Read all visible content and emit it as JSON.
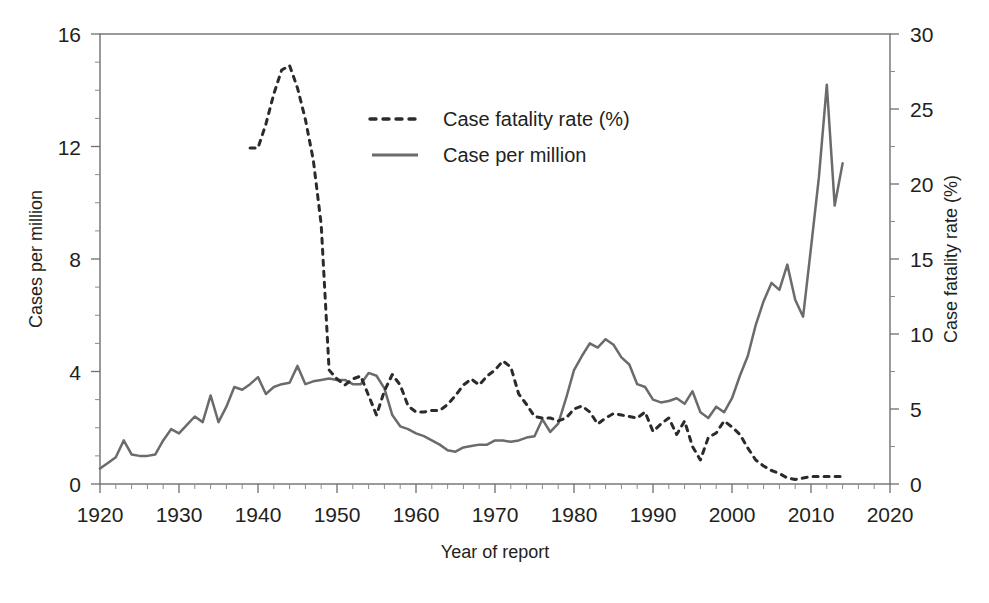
{
  "chart_data": {
    "type": "line",
    "title": "",
    "xlabel": "Year of report",
    "ylabel": "Cases per million",
    "y2label": "Case fatality rate (%)",
    "xlim": [
      1920,
      2020
    ],
    "ylim": [
      0,
      16
    ],
    "y2lim": [
      0,
      30
    ],
    "xticks": [
      1920,
      1930,
      1940,
      1950,
      1960,
      1970,
      1980,
      1990,
      2000,
      2010,
      2020
    ],
    "yticks": [
      0,
      4,
      8,
      12,
      16
    ],
    "y2ticks": [
      0,
      5,
      10,
      15,
      20,
      25,
      30
    ],
    "xtick_labels": [
      "1920",
      "1930",
      "1940",
      "1950",
      "1960",
      "1970",
      "1980",
      "1990",
      "2000",
      "2010",
      "2020"
    ],
    "ytick_labels": [
      "0",
      "4",
      "8",
      "12",
      "16"
    ],
    "y2tick_labels": [
      "0",
      "5",
      "10",
      "15",
      "20",
      "25",
      "30"
    ],
    "minor_tick_interval": 2,
    "grid": false,
    "legend_position": "upper-center",
    "series": [
      {
        "name": "Case fatality rate (%)",
        "axis": "right",
        "style": "dashed",
        "color": "#2b2b2b",
        "x": [
          1939,
          1940,
          1941,
          1942,
          1943,
          1944,
          1945,
          1946,
          1947,
          1948,
          1949,
          1950,
          1951,
          1952,
          1953,
          1954,
          1955,
          1956,
          1957,
          1958,
          1959,
          1960,
          1961,
          1962,
          1963,
          1964,
          1965,
          1966,
          1967,
          1968,
          1969,
          1970,
          1971,
          1972,
          1973,
          1974,
          1975,
          1976,
          1977,
          1978,
          1979,
          1980,
          1981,
          1982,
          1983,
          1984,
          1985,
          1986,
          1987,
          1988,
          1989,
          1990,
          1991,
          1992,
          1993,
          1994,
          1995,
          1996,
          1997,
          1998,
          1999,
          2000,
          2001,
          2002,
          2003,
          2004,
          2005,
          2006,
          2007,
          2008,
          2009,
          2010,
          2011,
          2012,
          2013,
          2014
        ],
        "values": [
          22.4,
          22.4,
          24.0,
          26.0,
          27.6,
          27.9,
          26.4,
          24.3,
          21.6,
          17.3,
          7.6,
          7.0,
          6.6,
          7.0,
          7.2,
          5.9,
          4.6,
          6.2,
          7.3,
          6.6,
          5.2,
          4.8,
          4.8,
          4.9,
          4.9,
          5.3,
          5.9,
          6.6,
          7.0,
          6.6,
          7.2,
          7.6,
          8.2,
          7.8,
          6.0,
          5.3,
          4.5,
          4.4,
          4.4,
          4.2,
          4.4,
          5.0,
          5.2,
          4.8,
          4.0,
          4.4,
          4.7,
          4.6,
          4.5,
          4.4,
          4.8,
          3.5,
          4.0,
          4.4,
          3.3,
          4.2,
          2.5,
          1.6,
          3.1,
          3.4,
          4.2,
          3.8,
          3.3,
          2.4,
          1.6,
          1.2,
          0.9,
          0.7,
          0.4,
          0.3,
          0.4,
          0.5,
          0.5,
          0.5,
          0.5,
          0.5
        ]
      },
      {
        "name": "Case per million",
        "axis": "left",
        "style": "solid",
        "color": "#6b6b6b",
        "x": [
          1920,
          1921,
          1922,
          1923,
          1924,
          1925,
          1926,
          1927,
          1928,
          1929,
          1930,
          1931,
          1932,
          1933,
          1934,
          1935,
          1936,
          1937,
          1938,
          1939,
          1940,
          1941,
          1942,
          1943,
          1944,
          1945,
          1946,
          1947,
          1948,
          1949,
          1950,
          1951,
          1952,
          1953,
          1954,
          1955,
          1956,
          1957,
          1958,
          1959,
          1960,
          1961,
          1962,
          1963,
          1964,
          1965,
          1966,
          1967,
          1968,
          1969,
          1970,
          1971,
          1972,
          1973,
          1974,
          1975,
          1976,
          1977,
          1978,
          1979,
          1980,
          1981,
          1982,
          1983,
          1984,
          1985,
          1986,
          1987,
          1988,
          1989,
          1990,
          1991,
          1992,
          1993,
          1994,
          1995,
          1996,
          1997,
          1998,
          1999,
          2000,
          2001,
          2002,
          2003,
          2004,
          2005,
          2006,
          2007,
          2008,
          2009,
          2010,
          2011,
          2012,
          2013,
          2014
        ],
        "values": [
          0.55,
          0.75,
          0.95,
          1.55,
          1.05,
          1.0,
          1.0,
          1.05,
          1.55,
          1.95,
          1.8,
          2.1,
          2.4,
          2.2,
          3.15,
          2.2,
          2.75,
          3.45,
          3.35,
          3.55,
          3.8,
          3.2,
          3.45,
          3.55,
          3.6,
          4.2,
          3.55,
          3.65,
          3.7,
          3.75,
          3.7,
          3.7,
          3.55,
          3.55,
          3.95,
          3.85,
          3.4,
          2.45,
          2.05,
          1.95,
          1.8,
          1.7,
          1.55,
          1.4,
          1.2,
          1.15,
          1.3,
          1.35,
          1.4,
          1.4,
          1.55,
          1.55,
          1.5,
          1.55,
          1.65,
          1.7,
          2.3,
          1.85,
          2.15,
          3.05,
          4.05,
          4.55,
          5.0,
          4.85,
          5.15,
          4.95,
          4.5,
          4.25,
          3.55,
          3.45,
          3.0,
          2.9,
          2.95,
          3.05,
          2.85,
          3.3,
          2.55,
          2.35,
          2.75,
          2.55,
          3.05,
          3.85,
          4.55,
          5.65,
          6.5,
          7.15,
          6.9,
          7.8,
          6.55,
          5.95,
          8.4,
          10.9,
          14.2,
          9.9,
          11.4
        ]
      }
    ]
  },
  "axes": {
    "left_title": "Cases per million",
    "right_title": "Case fatality rate (%)",
    "bottom_title": "Year of report"
  },
  "legend": {
    "items": [
      {
        "label": "Case fatality rate (%)",
        "style": "dashed"
      },
      {
        "label": "Case per million",
        "style": "solid"
      }
    ]
  },
  "colors": {
    "solid_series": "#6b6b6b",
    "dashed_series": "#2b2b2b",
    "axis": "#6f6f6f",
    "text": "#231f20",
    "background": "#ffffff"
  }
}
